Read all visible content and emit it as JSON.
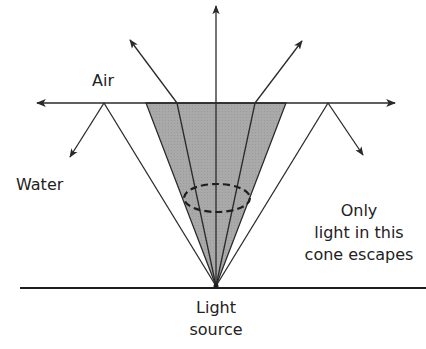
{
  "diagram": {
    "labels": {
      "air": "Air",
      "water": "Water",
      "cone_note_line1": "Only",
      "cone_note_line2": "light in this",
      "cone_note_line3": "cone escapes",
      "source_line1": "Light",
      "source_line2": "source"
    },
    "colors": {
      "line": "#2a2a2a",
      "cone_fill": "#a9a9a9",
      "background": "#ffffff"
    },
    "geometry": {
      "surface_y": 103,
      "ground_y": 288,
      "source": [
        216,
        286
      ],
      "cone_top_left_x": 146,
      "cone_top_right_x": 286,
      "escaping_rays": [
        {
          "hit_x": 177,
          "out_end": [
            130,
            40
          ]
        },
        {
          "hit_x": 216,
          "out_end": [
            216,
            6
          ]
        },
        {
          "hit_x": 255,
          "out_end": [
            302,
            41
          ]
        }
      ],
      "reflected_rays": [
        {
          "hit_x": 104,
          "reflect_end": [
            70,
            157
          ]
        },
        {
          "hit_x": 328,
          "reflect_end": [
            363,
            155
          ]
        }
      ],
      "grazing_arrows": {
        "left_end_x": 37,
        "right_end_x": 395
      },
      "ellipse": {
        "cx": 217,
        "cy": 198,
        "rx": 33,
        "ry": 14
      }
    }
  }
}
